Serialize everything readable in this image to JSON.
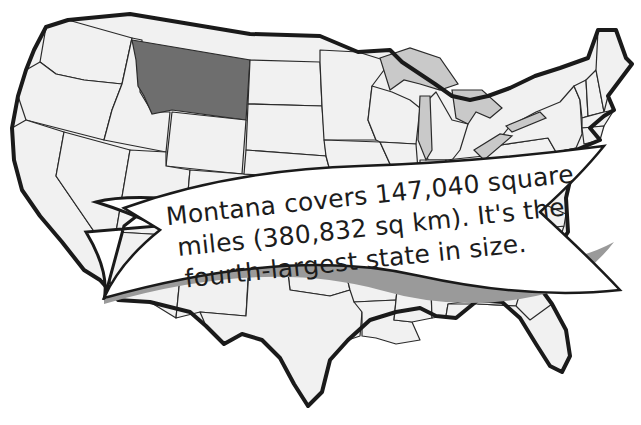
{
  "map": {
    "subject": "United States map",
    "highlighted_state": {
      "name": "Montana",
      "fill_color": "#6e6e6e"
    },
    "base_state_color": "#f1f1f1",
    "lake_color": "#c9c9c9",
    "border_color": "#1a1a1a"
  },
  "banner": {
    "line1": "Montana covers 147,040 square",
    "line2": "miles (380,832 sq km). It's the",
    "line3": "fourth-largest state in size.",
    "fill_color": "#ffffff",
    "shadow_color": "#9a9a9a"
  }
}
